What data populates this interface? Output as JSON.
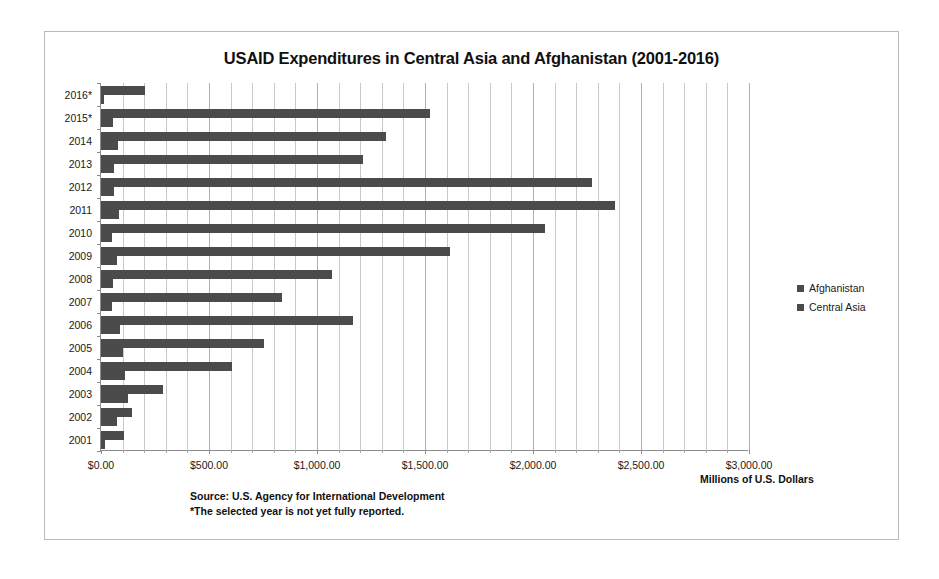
{
  "chart_data": {
    "type": "bar",
    "orientation": "horizontal",
    "title": "USAID Expenditures in Central Asia and Afghanistan (2001-2016)",
    "xlabel": "Millions of U.S. Dollars",
    "ylabel": "",
    "xlim": [
      0,
      3000
    ],
    "xticks": [
      0,
      500,
      1000,
      1500,
      2000,
      2500,
      3000
    ],
    "xticklabels": [
      "$0.00",
      "$500.00",
      "$1,000.00",
      "$1,500.00",
      "$2,000.00",
      "$2,500.00",
      "$3,000.00"
    ],
    "minor_tick_step": 100,
    "grid": true,
    "grid_axis": "x",
    "legend_position": "right",
    "categories": [
      "2016*",
      "2015*",
      "2014",
      "2013",
      "2012",
      "2011",
      "2010",
      "2009",
      "2008",
      "2007",
      "2006",
      "2005",
      "2004",
      "2003",
      "2002",
      "2001"
    ],
    "series": [
      {
        "name": "Afghanistan",
        "color": "#4b4b4b",
        "values": [
          205,
          1525,
          1320,
          1215,
          2275,
          2380,
          2055,
          1615,
          1070,
          840,
          1165,
          755,
          605,
          285,
          145,
          105
        ]
      },
      {
        "name": "Central Asia",
        "color": "#4b4b4b",
        "values": [
          12,
          55,
          80,
          60,
          60,
          85,
          50,
          75,
          55,
          50,
          90,
          100,
          110,
          125,
          75,
          20
        ]
      }
    ],
    "annotations": [
      "Source: U.S. Agency for International Development",
      "*The selected year is not yet fully reported."
    ]
  },
  "legend": {
    "items": [
      {
        "label": "Afghanistan"
      },
      {
        "label": "Central Asia"
      }
    ]
  },
  "footer": {
    "axis_unit": "Millions of U.S. Dollars",
    "source_line": "Source: U.S. Agency for International Development",
    "note_line": "*The selected year is not yet fully reported."
  }
}
